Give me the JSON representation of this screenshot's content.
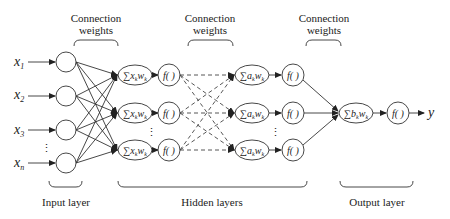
{
  "diagram": {
    "type": "feedforward-neural-network",
    "top_labels": [
      {
        "line1": "Connection",
        "line2": "weights"
      },
      {
        "line1": "Connection",
        "line2": "weights"
      },
      {
        "line1": "Connection",
        "line2": "weights"
      }
    ],
    "bottom_labels": {
      "input": "Input layer",
      "hidden": "Hidden layers",
      "output": "Output layer"
    },
    "inputs": [
      {
        "name": "x",
        "sub": "1"
      },
      {
        "name": "x",
        "sub": "2"
      },
      {
        "name": "x",
        "sub": "3"
      },
      {
        "name": "x",
        "sub": "n"
      }
    ],
    "ellipsis": "⋮",
    "hidden1_sum": {
      "sigma": "∑",
      "a": "x",
      "w": "w",
      "sub": "k"
    },
    "hidden2_sum": {
      "sigma": "∑",
      "a": "a",
      "w": "w",
      "sub": "k"
    },
    "output_sum": {
      "sigma": "∑",
      "a": "b",
      "w": "w",
      "sub": "k"
    },
    "activation": "f( )",
    "output": "y"
  }
}
